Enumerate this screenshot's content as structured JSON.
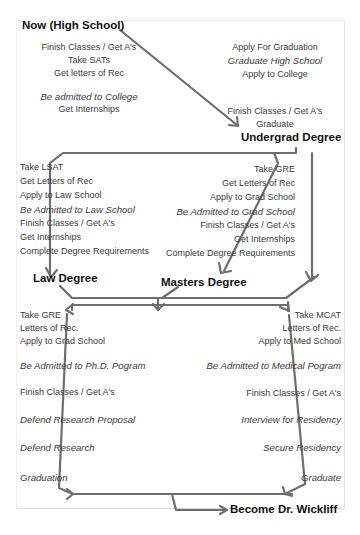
{
  "diagram": {
    "title": "Become Dr. Wickliff",
    "stages": {
      "high_school": {
        "heading": "Now (High School)",
        "left_steps": [
          "Finish Classes / Get A's",
          "Take SATs",
          "Get letters of Rec"
        ],
        "left_italic": "Be admitted to College",
        "left_after": "Get Internships",
        "right_steps": [
          "Apply For Graduation"
        ],
        "right_italic": "Graduate High School",
        "right_after": "Apply to College",
        "right_bottom": [
          "Finish Classes / Get A's",
          "Graduate"
        ]
      },
      "undergrad": {
        "heading": "Undergrad Degree"
      },
      "law_track": {
        "steps": [
          "Take LSAT",
          "Get Letters of Rec",
          "Apply to Law School"
        ],
        "italic": "Be Admitted to Law School",
        "after": [
          "Finish Classes / Get A's",
          "Get Internships",
          "Complete Degree Requirements"
        ],
        "heading": "Law Degree"
      },
      "masters_track": {
        "steps": [
          "Take GRE",
          "Get Letters of Rec",
          "Apply to Grad School"
        ],
        "italic": "Be Admitted to Grad School",
        "after": [
          "Finish Classes / Get A's",
          "Get Internships",
          "Complete Degree Requirements"
        ],
        "heading": "Masters Degree"
      },
      "phd_track": {
        "steps": [
          "Take GRE",
          "Letters of Rec.",
          "Apply to Grad School"
        ],
        "italic_1": "Be Admitted to Ph.D. Pogram",
        "middle": "Finish Classes / Get A's",
        "italic_2": "Defend Research Proposal",
        "italic_3": "Defend Research",
        "italic_4": "Graduation"
      },
      "medical_track": {
        "steps": [
          "Take MCAT",
          "Letters of Rec.",
          "Apply to Med School"
        ],
        "italic_1": "Be Admitted to Medical Pogram",
        "middle": "Finish Classes / Get A's",
        "italic_2": "Interview for Residency",
        "italic_3": "Secure Residency",
        "italic_4": "Graduate"
      },
      "final": {
        "heading": "Become Dr. Wickliff"
      }
    },
    "colors": {
      "arrow": "#6e6e6e",
      "text": "#3a3a3a",
      "heading": "#111111",
      "background": "#ffffff"
    }
  }
}
